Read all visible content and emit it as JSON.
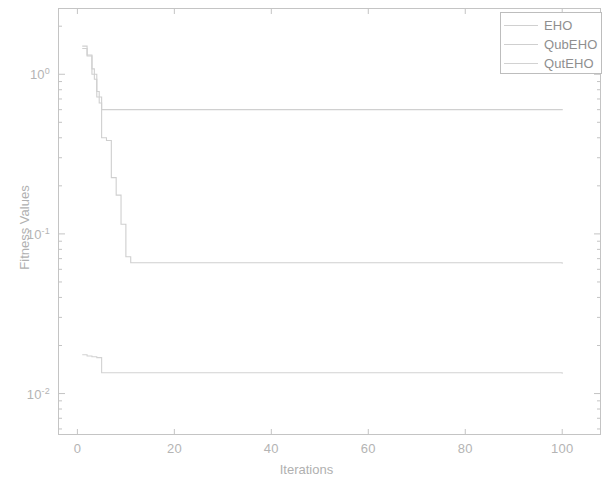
{
  "chart_data": {
    "type": "line",
    "title": "",
    "xlabel": "Iterations",
    "ylabel": "Fitness Values",
    "yscale": "log",
    "xlim": [
      -4,
      108
    ],
    "ylim": [
      0.0055,
      2.6
    ],
    "grid": false,
    "legend_position": "top-right",
    "xticks": [
      0,
      20,
      40,
      60,
      80,
      100
    ],
    "xtick_labels": [
      "0",
      "20",
      "40",
      "60",
      "80",
      "100"
    ],
    "yticks": [
      1,
      0.1,
      0.01
    ],
    "ytick_labels": [
      "10 0",
      "10 -1",
      "10 -2"
    ],
    "ytick_mantissa": [
      "10",
      "10",
      "10"
    ],
    "ytick_exponent": [
      "0",
      "-1",
      "-2"
    ],
    "series": [
      {
        "name": "EHO",
        "color": "#d0d0d0",
        "x": [
          1,
          2,
          3,
          3.5,
          4,
          4.5,
          5,
          100
        ],
        "values": [
          1.45,
          1.32,
          1.08,
          0.93,
          0.78,
          0.66,
          0.6,
          0.595
        ]
      },
      {
        "name": "QubEHO",
        "color": "#cfcfcf",
        "x": [
          1,
          2,
          3,
          4,
          5,
          6,
          7,
          8,
          9,
          10,
          11,
          100
        ],
        "values": [
          1.5,
          1.3,
          1.0,
          0.72,
          0.4,
          0.385,
          0.225,
          0.175,
          0.115,
          0.072,
          0.066,
          0.065
        ]
      },
      {
        "name": "QutEHO",
        "color": "#d2d2d2",
        "x": [
          1,
          2,
          3,
          4,
          5,
          100
        ],
        "values": [
          0.0175,
          0.0172,
          0.017,
          0.0168,
          0.0135,
          0.0133
        ]
      }
    ]
  },
  "legend": {
    "entries": [
      {
        "label": "EHO"
      },
      {
        "label": "QubEHO"
      },
      {
        "label": "QutEHO"
      }
    ]
  },
  "colors": {
    "axis": "#c4c4c4",
    "text": "#b4b4b4",
    "background": "#ffffff"
  }
}
